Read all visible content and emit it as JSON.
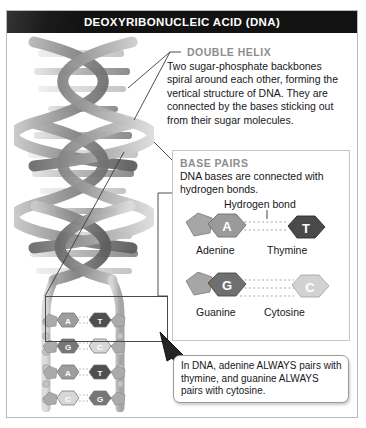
{
  "title": "DEOXYRIBONUCLEIC ACID (DNA)",
  "sections": {
    "double_helix": {
      "heading": "DOUBLE HELIX",
      "body": "Two sugar-phosphate backbones spiral around each other, forming the vertical structure of DNA. They are connected by the bases sticking out from their sugar molecules."
    },
    "base_pairs": {
      "heading": "BASE PAIRS",
      "body": "DNA bases are connected with hydrogen bonds.",
      "bond_label": "Hydrogen bond",
      "pairs": [
        {
          "left": {
            "letter": "A",
            "name": "Adenine",
            "shade": "#9a9a9a",
            "text": "#ffffff"
          },
          "right": {
            "letter": "T",
            "name": "Thymine",
            "shade": "#4a4a4a",
            "text": "#ffffff"
          }
        },
        {
          "left": {
            "letter": "G",
            "name": "Guanine",
            "shade": "#6f6f6f",
            "text": "#ffffff"
          },
          "right": {
            "letter": "C",
            "name": "Cytosine",
            "shade": "#d2d2d2",
            "text": "#ffffff"
          }
        }
      ]
    }
  },
  "callout": {
    "text": "In DNA, adenine ALWAYS pairs with thymine, and guanine ALWAYS pairs with cytosine."
  },
  "ladder": {
    "rungs": [
      {
        "left": "A",
        "right": "T",
        "left_shade": "#9d9d9d",
        "right_shade": "#4f4f4f"
      },
      {
        "left": "G",
        "right": "C",
        "left_shade": "#777777",
        "right_shade": "#d7d7d7"
      },
      {
        "left": "A",
        "right": "T",
        "left_shade": "#9d9d9d",
        "right_shade": "#4f4f4f"
      },
      {
        "left": "C",
        "right": "G",
        "left_shade": "#d7d7d7",
        "right_shade": "#777777"
      },
      {
        "left": "T",
        "right": "A",
        "left_shade": "#4f4f4f",
        "right_shade": "#9d9d9d"
      }
    ]
  },
  "colors": {
    "title_bg": "#121212",
    "title_fg": "#ffffff",
    "heading_gray": "#8e8e8e",
    "body_text": "#17171a",
    "frame_border": "#b9b9b9",
    "panel_border": "#c6c6c6",
    "bond_dots": "#b0b0b0"
  }
}
